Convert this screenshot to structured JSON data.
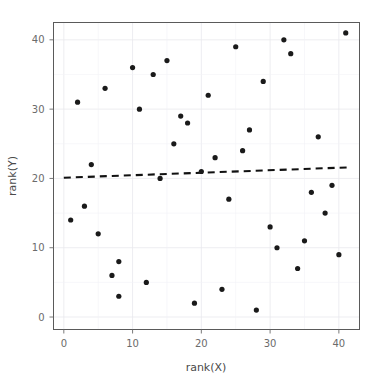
{
  "chart_data": {
    "type": "scatter",
    "title": "",
    "subtitle": "",
    "xlabel": "rank(X)",
    "ylabel": "rank(Y)",
    "xlim": [
      -1.5,
      43.0
    ],
    "ylim": [
      -1.8,
      42.5
    ],
    "xticks": [
      0,
      10,
      20,
      30,
      40
    ],
    "yticks": [
      0,
      10,
      20,
      30,
      40
    ],
    "xtick_labels": [
      "0",
      "10",
      "20",
      "30",
      "40"
    ],
    "ytick_labels": [
      "0",
      "10",
      "20",
      "30",
      "40"
    ],
    "grid": true,
    "legend": "none",
    "point_color": "#1a1a1a",
    "point_size": 2.6,
    "panel_border_color": "#5a5a5a",
    "grid_color": "#e8e8ee",
    "background": "#ffffff",
    "series": [
      {
        "name": "rank pairs",
        "marker": "circle",
        "x": [
          1,
          2,
          3,
          5,
          6,
          7,
          8,
          8,
          10,
          12,
          13,
          14,
          15,
          16,
          17,
          18,
          19,
          21,
          22,
          23,
          24,
          25,
          26,
          27,
          28,
          29,
          30,
          31,
          32,
          33,
          34,
          35,
          36,
          37,
          38,
          39,
          40,
          41,
          4,
          11,
          20
        ],
        "y": [
          14,
          31,
          16,
          12,
          33,
          6,
          8,
          3,
          36,
          5,
          35,
          20,
          37,
          25,
          29,
          28,
          2,
          32,
          23,
          4,
          17,
          39,
          24,
          27,
          1,
          34,
          13,
          10,
          40,
          38,
          7,
          11,
          18,
          26,
          15,
          19,
          9,
          41,
          22,
          30,
          21
        ]
      }
    ],
    "fit_line": {
      "name": "linear fit",
      "style": "dashed",
      "color": "#111111",
      "x": [
        0.0,
        41.5
      ],
      "y": [
        20.1,
        21.6
      ],
      "slope": 0.036,
      "intercept": 20.1
    }
  },
  "axes": {
    "x_label": "rank(X)",
    "y_label": "rank(Y)"
  }
}
